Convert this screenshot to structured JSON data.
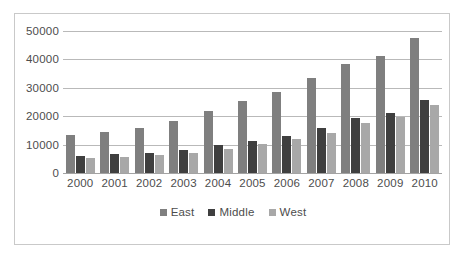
{
  "chart_data": {
    "type": "bar",
    "title": "",
    "subtitle": "",
    "xlabel": "",
    "ylabel": "",
    "categories": [
      "2000",
      "2001",
      "2002",
      "2003",
      "2004",
      "2005",
      "2006",
      "2007",
      "2008",
      "2009",
      "2010"
    ],
    "series": [
      {
        "name": "East",
        "color": "#7f7f7f",
        "values": [
          13300,
          14500,
          16000,
          18300,
          21700,
          25200,
          28600,
          33400,
          38500,
          41200,
          47500
        ]
      },
      {
        "name": "Middle",
        "color": "#3f3f3f",
        "values": [
          6000,
          6700,
          7200,
          8100,
          9900,
          11400,
          13200,
          15900,
          19200,
          21000,
          25600
        ]
      },
      {
        "name": "West",
        "color": "#a8a8a8",
        "values": [
          5200,
          5600,
          6200,
          7100,
          8500,
          10100,
          11900,
          14200,
          17700,
          19600,
          23800
        ]
      }
    ],
    "ylim": [
      0,
      50000
    ],
    "ytick_values": [
      0,
      10000,
      20000,
      30000,
      40000,
      50000
    ],
    "ytick_labels": [
      "0",
      "10000",
      "20000",
      "30000",
      "40000",
      "50000"
    ],
    "grid": true,
    "legend_position": "bottom",
    "legend": [
      "East",
      "Middle",
      "West"
    ]
  }
}
